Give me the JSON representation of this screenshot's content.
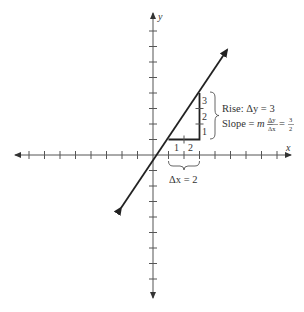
{
  "diagram": {
    "type": "slope-of-line",
    "axes": {
      "x_label": "x",
      "y_label": "y",
      "x_ticks_negative": 8,
      "x_ticks_positive": 8,
      "y_ticks_positive": 8,
      "y_ticks_negative": 6
    },
    "line": {
      "equation": "y = 1.5x - 0.5",
      "points": [
        [
          1,
          1
        ],
        [
          3,
          4
        ]
      ],
      "color": "#222222"
    },
    "run": {
      "tick_labels": [
        "1",
        "2"
      ],
      "label": "Δx = 2"
    },
    "rise": {
      "tick_labels": [
        "3",
        "2",
        "1"
      ],
      "label": "Rise: Δy = 3"
    },
    "slope": {
      "prefix": "Slope = ",
      "m": "m",
      "equals": " = ",
      "num": "Δy",
      "den": "Δx",
      "equals2": " = ",
      "value_num": "3",
      "value_den": "2"
    },
    "colors": {
      "axis": "#555555",
      "line": "#222222",
      "text": "#333333"
    }
  }
}
